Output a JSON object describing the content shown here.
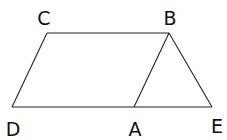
{
  "diagram": {
    "type": "geometry-figure",
    "points": [
      {
        "id": "C",
        "label": "C",
        "x": 47,
        "y": 33,
        "lx": 44,
        "ly": 25
      },
      {
        "id": "B",
        "label": "B",
        "x": 169,
        "y": 33,
        "lx": 170,
        "ly": 25
      },
      {
        "id": "D",
        "label": "D",
        "x": 12,
        "y": 107,
        "lx": 13,
        "ly": 136
      },
      {
        "id": "A",
        "label": "A",
        "x": 134,
        "y": 107,
        "lx": 135,
        "ly": 136
      },
      {
        "id": "E",
        "label": "E",
        "x": 212,
        "y": 107,
        "lx": 217,
        "ly": 133
      }
    ],
    "segments": [
      {
        "name": "segment-CB",
        "from": "C",
        "to": "B"
      },
      {
        "name": "segment-CD",
        "from": "C",
        "to": "D"
      },
      {
        "name": "segment-DE",
        "from": "D",
        "to": "E"
      },
      {
        "name": "segment-BA",
        "from": "B",
        "to": "A"
      },
      {
        "name": "segment-BE",
        "from": "B",
        "to": "E"
      }
    ]
  }
}
